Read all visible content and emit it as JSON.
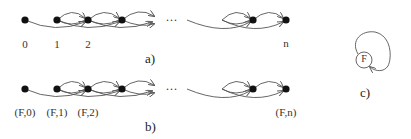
{
  "diagram": {
    "panel_a": {
      "caption": "a)",
      "node_labels": [
        "0",
        "1",
        "2",
        "n"
      ],
      "ellipsis": "..."
    },
    "panel_b": {
      "caption": "b)",
      "node_labels": [
        "(F,0)",
        "(F,1)",
        "(F,2)",
        "(F,n)"
      ],
      "ellipsis": "..."
    },
    "panel_c": {
      "caption": "c)",
      "node_label": "F"
    },
    "colors": {
      "node_fill": "#111111",
      "edge_stroke": "#555555",
      "text": "#333333"
    }
  }
}
